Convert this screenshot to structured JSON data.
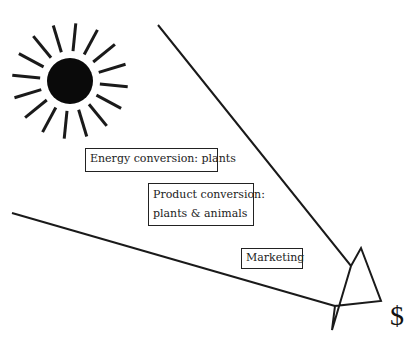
{
  "diagram": {
    "sun": {
      "icon": "sun-icon",
      "center": [
        70,
        81
      ],
      "radius": 23
    },
    "boxes": [
      {
        "id": "energy",
        "label": "Energy conversion: plants"
      },
      {
        "id": "product",
        "line1": "Product conversion:",
        "line2": "plants & animals"
      },
      {
        "id": "marketing",
        "label": "Marketing"
      }
    ],
    "arrows": [
      {
        "name": "upper-arrow",
        "from": [
          158,
          25
        ],
        "to": [
          381,
          301
        ]
      },
      {
        "name": "lower-arrow",
        "from": [
          12,
          213
        ],
        "to": [
          381,
          301
        ]
      }
    ],
    "result_symbol": "$",
    "colors": {
      "stroke": "#1a1a1a",
      "background": "#ffffff"
    }
  }
}
